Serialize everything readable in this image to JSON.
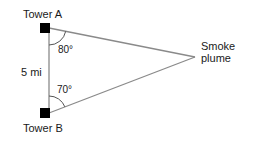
{
  "diagram": {
    "tower_a": {
      "label": "Tower A",
      "angle": "80°"
    },
    "tower_b": {
      "label": "Tower B",
      "angle": "70°"
    },
    "side_label": "5 mi",
    "target": {
      "line1": "Smoke",
      "line2": "plume"
    },
    "colors": {
      "line": "#8a8a8a",
      "tower": "#000000",
      "text": "#1a1a1a"
    }
  }
}
